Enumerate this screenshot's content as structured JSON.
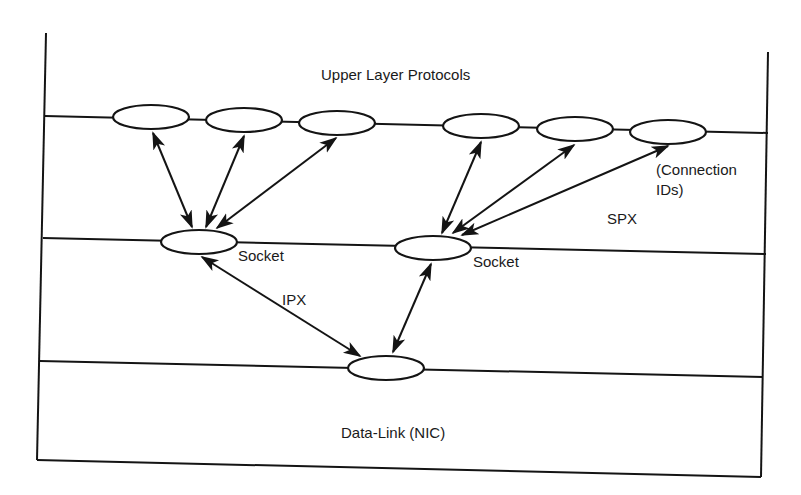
{
  "diagram": {
    "title": "Upper Layer Protocols",
    "layers": [
      {
        "name": "upper-layer",
        "label": "Upper Layer Protocols"
      },
      {
        "name": "ipx-socket",
        "label": "Socket"
      },
      {
        "name": "data-link",
        "label": "Data-Link (NIC)"
      }
    ],
    "labels": {
      "upper": "Upper Layer Protocols",
      "socket_left": "Socket",
      "socket_right": "Socket",
      "connection_line1": "(Connection",
      "connection_line2": "IDs)",
      "spx": "SPX",
      "ipx": "IPX",
      "datalink": "Data-Link (NIC)"
    },
    "nodes": {
      "upper": [
        {
          "id": "u1",
          "cx": 151,
          "cy": 117
        },
        {
          "id": "u2",
          "cx": 244,
          "cy": 120
        },
        {
          "id": "u3",
          "cx": 337,
          "cy": 123
        },
        {
          "id": "u4",
          "cx": 481,
          "cy": 126
        },
        {
          "id": "u5",
          "cx": 575,
          "cy": 129
        },
        {
          "id": "u6",
          "cx": 668,
          "cy": 132
        }
      ],
      "sockets": [
        {
          "id": "s1",
          "cx": 199,
          "cy": 242
        },
        {
          "id": "s2",
          "cx": 433,
          "cy": 248
        }
      ],
      "nic": {
        "id": "n1",
        "cx": 386,
        "cy": 368
      }
    },
    "connections": [
      {
        "from": "u1",
        "to": "s1",
        "type": "bidirectional"
      },
      {
        "from": "u2",
        "to": "s1",
        "type": "bidirectional"
      },
      {
        "from": "u3",
        "to": "s1",
        "type": "bidirectional"
      },
      {
        "from": "u4",
        "to": "s2",
        "type": "bidirectional"
      },
      {
        "from": "u5",
        "to": "s2",
        "type": "bidirectional"
      },
      {
        "from": "u6",
        "to": "s2",
        "type": "bidirectional"
      },
      {
        "from": "s1",
        "to": "n1",
        "type": "bidirectional",
        "label": "IPX"
      },
      {
        "from": "s2",
        "to": "n1",
        "type": "bidirectional"
      }
    ],
    "colors": {
      "stroke": "#141414",
      "background": "#ffffff"
    }
  }
}
